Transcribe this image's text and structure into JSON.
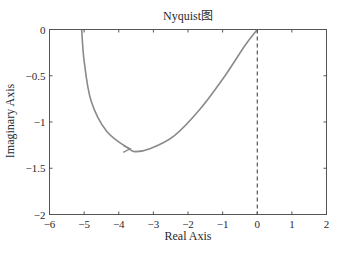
{
  "chart_data": {
    "type": "line",
    "title": "Nyquist图",
    "xlabel": "Real Axis",
    "ylabel": "Imaginary Axis",
    "xlim": [
      -6,
      2
    ],
    "ylim": [
      -2,
      0
    ],
    "xticks": [
      -6,
      -5,
      -4,
      -3,
      -2,
      -1,
      0,
      1,
      2
    ],
    "xtick_labels": [
      "-6",
      "-5",
      "-4",
      "-3",
      "-2",
      "-1",
      "0",
      "1",
      "2"
    ],
    "yticks": [
      0,
      -0.5,
      -1,
      -1.5,
      -2
    ],
    "ytick_labels": [
      "0",
      "-0.5",
      "-1",
      "-1.5",
      "-2"
    ],
    "grid": false,
    "legend": null,
    "series": [
      {
        "name": "Nyquist curve",
        "color": "#8a8a8a",
        "x": [
          -5.07,
          -5.0,
          -4.8,
          -4.35,
          -3.7,
          -3.5,
          -3.1,
          -2.4,
          -1.65,
          -0.93,
          -0.35,
          0.0
        ],
        "y": [
          0.0,
          -0.34,
          -0.77,
          -1.1,
          -1.29,
          -1.32,
          -1.29,
          -1.15,
          -0.86,
          -0.5,
          -0.17,
          0.0
        ]
      }
    ],
    "annotations": [
      {
        "type": "arrow",
        "x": -3.7,
        "y": -1.29,
        "direction": "right"
      },
      {
        "type": "vline",
        "x": 0,
        "style": "dashed",
        "color": "#333333"
      }
    ]
  },
  "colors": {
    "axes": "#555555",
    "curve": "#8a8a8a",
    "dashed_line": "#333333",
    "background": "#ffffff"
  }
}
